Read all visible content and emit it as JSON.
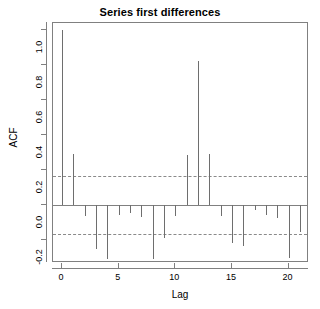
{
  "chart_data": {
    "type": "bar",
    "title": "Series first differences",
    "xlabel": "Lag",
    "ylabel": "ACF",
    "x": [
      0,
      1,
      2,
      3,
      4,
      5,
      6,
      7,
      8,
      9,
      10,
      11,
      12,
      13,
      14,
      15,
      16,
      17,
      18,
      19,
      20,
      21
    ],
    "values": [
      1.0,
      0.29,
      -0.06,
      -0.25,
      -0.31,
      -0.055,
      -0.045,
      -0.065,
      -0.31,
      -0.19,
      -0.06,
      0.285,
      0.825,
      0.29,
      -0.06,
      -0.215,
      -0.235,
      -0.03,
      -0.055,
      -0.075,
      -0.3,
      -0.155
    ],
    "categories": [
      "0",
      "1",
      "2",
      "3",
      "4",
      "5",
      "6",
      "7",
      "8",
      "9",
      "10",
      "11",
      "12",
      "13",
      "14",
      "15",
      "16",
      "17",
      "18",
      "19",
      "20",
      "21"
    ],
    "ylim": [
      -0.33,
      1.04
    ],
    "xlim": [
      -0.8,
      21.8
    ],
    "ytick_values": [
      1.0,
      0.8,
      0.6,
      0.4,
      0.2,
      0.0,
      -0.2
    ],
    "ytick_labels": [
      "1.0",
      "0.8",
      "0.6",
      "0.4",
      "0.2",
      "0.0",
      "-0.2"
    ],
    "xtick_values": [
      0,
      5,
      10,
      15,
      20
    ],
    "xtick_labels": [
      "0",
      "5",
      "10",
      "15",
      "20"
    ],
    "confidence_bands": [
      0.165,
      -0.165
    ],
    "confidence_style": "dashed",
    "zero_line": 0.0,
    "grid": false,
    "legend": null,
    "series_color": "#6e6e6e",
    "axis_color": "#808080",
    "conf_color": "#8a8a8a"
  }
}
